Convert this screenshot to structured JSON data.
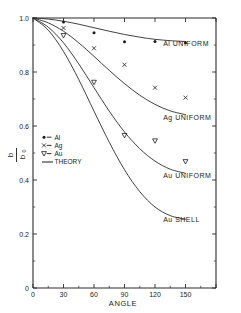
{
  "chart_data": {
    "type": "scatter",
    "title": "",
    "xlabel": "ANGLE",
    "ylabel": "b/b₀",
    "xlim": [
      0,
      180
    ],
    "ylim": [
      0,
      1.0
    ],
    "xticks": [
      "0",
      "30",
      "60",
      "90",
      "120",
      "150"
    ],
    "xtick_values": [
      0,
      30,
      60,
      90,
      120,
      150
    ],
    "yticks": [
      "0",
      "0.2",
      "0.4",
      "0.6",
      "0.8",
      "1.0"
    ],
    "ytick_values": [
      0,
      0.2,
      0.4,
      0.6,
      0.8,
      1.0
    ],
    "grid": false,
    "legend_position": "center-left",
    "legend": [
      {
        "label": "Al",
        "marker": "dot"
      },
      {
        "label": "Ag",
        "marker": "cross"
      },
      {
        "label": "Au",
        "marker": "triangle-down"
      },
      {
        "label": "THEORY",
        "marker": "line"
      }
    ],
    "series": [
      {
        "name": "Al",
        "marker": "dot",
        "x": [
          30,
          60,
          90,
          120,
          150
        ],
        "y": [
          0.985,
          0.945,
          0.912,
          0.913,
          0.908
        ]
      },
      {
        "name": "Ag",
        "marker": "cross",
        "x": [
          30,
          60,
          90,
          120,
          150
        ],
        "y": [
          0.963,
          0.888,
          0.827,
          0.742,
          0.705
        ]
      },
      {
        "name": "Au",
        "marker": "triangle-down",
        "x": [
          30,
          60,
          90,
          120,
          150
        ],
        "y": [
          0.935,
          0.762,
          0.565,
          0.545,
          0.468
        ]
      }
    ],
    "curves": [
      {
        "name": "Al UNIFORM",
        "label": "Al UNIFORM",
        "x": [
          0,
          15,
          30,
          45,
          60,
          75,
          90,
          105,
          120,
          135,
          150
        ],
        "y": [
          1.0,
          0.996,
          0.988,
          0.977,
          0.964,
          0.951,
          0.939,
          0.929,
          0.921,
          0.916,
          0.913
        ]
      },
      {
        "name": "Ag UNIFORM",
        "label": "Ag UNIFORM",
        "x": [
          0,
          15,
          30,
          45,
          60,
          75,
          90,
          105,
          120,
          135,
          150
        ],
        "y": [
          1.0,
          0.982,
          0.951,
          0.908,
          0.858,
          0.806,
          0.757,
          0.714,
          0.68,
          0.656,
          0.642
        ]
      },
      {
        "name": "Au UNIFORM",
        "label": "Au UNIFORM",
        "x": [
          0,
          15,
          30,
          45,
          60,
          75,
          90,
          105,
          120,
          135,
          150
        ],
        "y": [
          1.0,
          0.966,
          0.908,
          0.83,
          0.742,
          0.655,
          0.578,
          0.516,
          0.47,
          0.44,
          0.425
        ]
      },
      {
        "name": "Au SHELL",
        "label": "Au SHELL",
        "x": [
          0,
          15,
          30,
          45,
          60,
          75,
          90,
          105,
          120,
          135,
          150
        ],
        "y": [
          1.0,
          0.955,
          0.876,
          0.772,
          0.655,
          0.54,
          0.438,
          0.357,
          0.3,
          0.268,
          0.255
        ]
      }
    ],
    "annotations": [
      {
        "text": "Al UNIFORM",
        "x": 128,
        "y": 0.905
      },
      {
        "text": "Ag UNIFORM",
        "x": 128,
        "y": 0.633
      },
      {
        "text": "Au UNIFORM",
        "x": 128,
        "y": 0.417
      },
      {
        "text": "Au SHELL",
        "x": 128,
        "y": 0.252
      }
    ],
    "colors": {
      "ink": "#1a1a1a",
      "background": "#ffffff"
    }
  }
}
